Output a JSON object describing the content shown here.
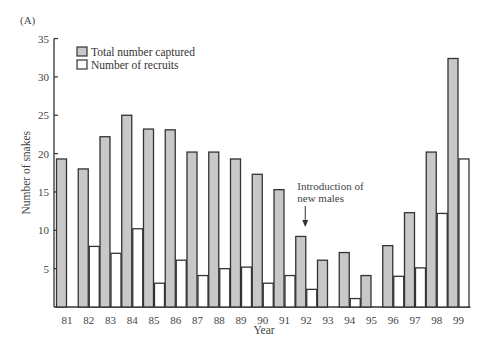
{
  "panel_label": "(A)",
  "chart_data": {
    "type": "bar",
    "title": "",
    "xlabel": "Year",
    "ylabel": "Number of snakes",
    "ylim": [
      0,
      35
    ],
    "yticks": [
      5,
      10,
      15,
      20,
      25,
      30,
      35
    ],
    "grid": false,
    "legend_position": "upper left",
    "categories": [
      "81",
      "82",
      "83",
      "84",
      "85",
      "86",
      "87",
      "88",
      "89",
      "90",
      "91",
      "92",
      "93",
      "94",
      "95",
      "96",
      "97",
      "98",
      "99"
    ],
    "series": [
      {
        "name": "Total number captured",
        "color": "#c8c8c8",
        "values": [
          19.3,
          18.0,
          22.2,
          25.0,
          23.2,
          23.1,
          20.2,
          20.2,
          19.3,
          17.3,
          15.3,
          9.2,
          6.1,
          7.1,
          4.1,
          8.0,
          12.3,
          20.2,
          32.4
        ]
      },
      {
        "name": "Number of recruits",
        "color": "#ffffff",
        "values": [
          0,
          7.9,
          7.0,
          10.2,
          3.1,
          6.1,
          4.1,
          5.0,
          5.2,
          3.1,
          4.1,
          2.3,
          0,
          1.1,
          0,
          4.0,
          5.1,
          12.2,
          19.3
        ]
      }
    ],
    "annotations": [
      {
        "text_line1": "Introduction of",
        "text_line2": "new males",
        "x": "92",
        "arrow": "down"
      }
    ]
  }
}
